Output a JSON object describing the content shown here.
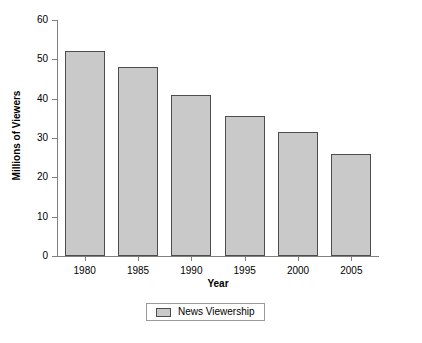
{
  "chart_data": {
    "type": "bar",
    "title": "",
    "categories": [
      "1980",
      "1985",
      "1990",
      "1995",
      "2000",
      "2005"
    ],
    "values": [
      52,
      48,
      41,
      35.5,
      31.5,
      26
    ],
    "series": [
      {
        "name": "News Viewership",
        "values": [
          52,
          48,
          41,
          35.5,
          31.5,
          26
        ]
      }
    ],
    "xlabel": "Year",
    "ylabel": "Millions of Viewers",
    "ylim": [
      0,
      60
    ],
    "yticks": [
      0,
      10,
      20,
      30,
      40,
      50,
      60
    ],
    "ytick_labels": [
      "0",
      "10",
      "20",
      "30",
      "40",
      "50",
      "60"
    ],
    "grid": false,
    "legend_position": "bottom-center",
    "bar_fill_color": "#c9c9c9",
    "bar_border_color": "#4d4d4d",
    "axis_color": "#808080",
    "background_color": "#ffffff"
  },
  "legend": {
    "entries": [
      {
        "label": "News Viewership",
        "color": "#c9c9c9"
      }
    ]
  }
}
